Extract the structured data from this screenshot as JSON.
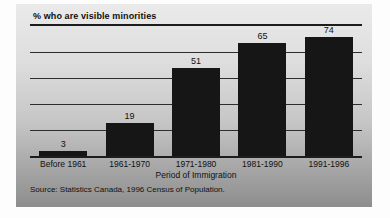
{
  "chart_data": {
    "type": "bar",
    "title": "% who are visible minorities",
    "categories": [
      "Before 1961",
      "1961-1970",
      "1971-1980",
      "1981-1990",
      "1991-1996"
    ],
    "values": [
      3,
      19,
      51,
      65,
      74
    ],
    "xlabel": "Period of Immigration",
    "ylabel": "",
    "ylim": [
      0,
      75
    ],
    "grid": true,
    "gridline_intervals": 5,
    "legend": false,
    "source_note": "Source: Statistics Canada, 1996 Census of Population.",
    "bar_color": "#161616",
    "gridline_color": "#2d2d2d",
    "axis_color": "#1c1c1c",
    "text_color": "#101010",
    "panel_gradient_top": "#eaeaea",
    "panel_gradient_bottom": "#8d8d8d"
  }
}
